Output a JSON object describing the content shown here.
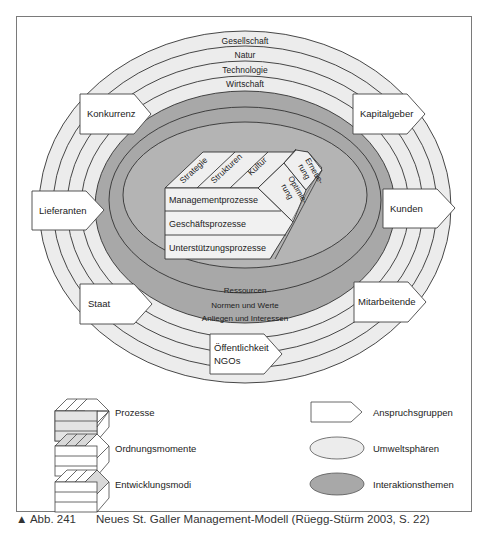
{
  "figure": {
    "title": "Neues St. Galler Management-Modell",
    "caption_marker": "▲ Abb. 241",
    "caption_text": "Neues St. Galler Management-Modell (Rüegg-Stürm 2003, S. 22)"
  },
  "colors": {
    "frame": "#7a7a7a",
    "umweltsphaeren_fill": "#ececec",
    "interaktionsthemen_fill": "#a8a8a8",
    "inner_fill": "#bdbdbd",
    "box_fill": "#ffffff",
    "line": "#333333",
    "process_row_fill": "#e4e4e4"
  },
  "umweltsphaeren": [
    "Gesellschaft",
    "Natur",
    "Technologie",
    "Wirtschaft"
  ],
  "interaktionsthemen": [
    "Ressourcen",
    "Normen und Werte",
    "Anliegen und Interessen"
  ],
  "anspruchsgruppen": {
    "konkurrenz": "Konkurrenz",
    "kapitalgeber": "Kapitalgeber",
    "lieferanten": "Lieferanten",
    "kunden": "Kunden",
    "staat": "Staat",
    "mitarbeitende": "Mitarbeitende",
    "oeffentlichkeit_line1": "Öffentlichkeit",
    "oeffentlichkeit_line2": "NGOs"
  },
  "core_block": {
    "ordnungsmomente": [
      "Strategie",
      "Strukturen",
      "Kultur"
    ],
    "entwicklungsmodi": {
      "erneuerung_line1": "Erneue-",
      "erneuerung_line2": "rung",
      "optimierung_line1": "Optimie-",
      "optimierung_line2": "rung"
    },
    "prozesse": [
      "Managementprozesse",
      "Geschäftsprozesse",
      "Unterstützungsprozesse"
    ]
  },
  "legend": {
    "left": [
      {
        "icon": "process-block-icon",
        "label": "Prozesse"
      },
      {
        "icon": "order-block-icon",
        "label": "Ordnungsmomente"
      },
      {
        "icon": "development-block-icon",
        "label": "Entwicklungsmodi"
      }
    ],
    "right": [
      {
        "icon": "stakeholder-arrow-icon",
        "label": "Anspruchsgruppen"
      },
      {
        "icon": "light-ellipse-icon",
        "label": "Umweltsphären"
      },
      {
        "icon": "dark-ellipse-icon",
        "label": "Interaktionsthemen"
      }
    ]
  }
}
